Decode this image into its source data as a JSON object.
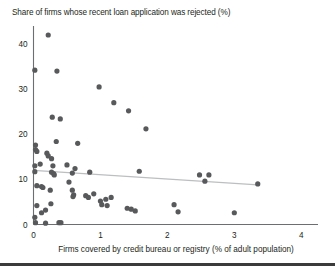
{
  "chart_data": {
    "type": "scatter",
    "title": "Share of firms whose recent loan application was rejected (%)",
    "xlabel": "Firms covered by credit bureau or registry (% of adult population)",
    "ylabel": "",
    "xlim": [
      0,
      4.25
    ],
    "ylim": [
      0,
      44
    ],
    "xticks": [
      0,
      1,
      2,
      3,
      4
    ],
    "xtick_labels": [
      "0",
      "1",
      "2",
      "3",
      "4"
    ],
    "yticks": [
      0,
      10,
      20,
      30,
      40
    ],
    "ytick_labels": [
      "0",
      "10",
      "20",
      "30",
      "40"
    ],
    "grid": false,
    "legend": null,
    "point_color": "#58595b",
    "trend_color": "#bcbec0",
    "axis_color": "#6d6e71",
    "series": [
      {
        "name": "Countries",
        "points": [
          [
            0.22,
            42.0
          ],
          [
            0.02,
            34.2
          ],
          [
            0.35,
            34.0
          ],
          [
            0.98,
            30.5
          ],
          [
            1.2,
            27.0
          ],
          [
            1.42,
            25.2
          ],
          [
            0.28,
            23.8
          ],
          [
            0.4,
            23.4
          ],
          [
            0.03,
            17.6
          ],
          [
            0.03,
            16.6
          ],
          [
            0.05,
            16.2
          ],
          [
            0.34,
            18.4
          ],
          [
            0.66,
            18.0
          ],
          [
            0.2,
            15.8
          ],
          [
            0.22,
            15.2
          ],
          [
            0.27,
            14.6
          ],
          [
            0.02,
            13.0
          ],
          [
            0.1,
            13.4
          ],
          [
            0.29,
            13.0
          ],
          [
            0.5,
            13.2
          ],
          [
            0.62,
            12.4
          ],
          [
            0.02,
            11.7
          ],
          [
            0.27,
            11.6
          ],
          [
            0.3,
            11.3
          ],
          [
            0.31,
            11.0
          ],
          [
            0.58,
            11.4
          ],
          [
            0.84,
            11.6
          ],
          [
            1.68,
            21.2
          ],
          [
            1.58,
            11.8
          ],
          [
            2.48,
            11.0
          ],
          [
            2.62,
            11.0
          ],
          [
            2.56,
            9.6
          ],
          [
            3.35,
            9.0
          ],
          [
            0.05,
            8.6
          ],
          [
            0.12,
            8.4
          ],
          [
            0.14,
            8.2
          ],
          [
            0.25,
            7.6
          ],
          [
            0.53,
            9.4
          ],
          [
            0.58,
            7.6
          ],
          [
            0.6,
            6.6
          ],
          [
            0.59,
            6.2
          ],
          [
            0.78,
            6.4
          ],
          [
            0.82,
            6.0
          ],
          [
            0.9,
            6.8
          ],
          [
            1.0,
            5.2
          ],
          [
            1.08,
            5.6
          ],
          [
            1.16,
            6.0
          ],
          [
            1.02,
            4.4
          ],
          [
            1.1,
            4.2
          ],
          [
            0.26,
            4.6
          ],
          [
            0.05,
            4.2
          ],
          [
            0.18,
            3.2
          ],
          [
            0.12,
            2.6
          ],
          [
            0.02,
            1.6
          ],
          [
            0.03,
            0.4
          ],
          [
            0.18,
            0.3
          ],
          [
            0.38,
            0.4
          ],
          [
            0.41,
            0.4
          ],
          [
            1.4,
            3.6
          ],
          [
            1.46,
            3.4
          ],
          [
            1.52,
            3.0
          ],
          [
            2.1,
            4.4
          ],
          [
            2.16,
            2.8
          ],
          [
            3.0,
            2.6
          ]
        ]
      }
    ],
    "trend": {
      "name": "fitted-trend",
      "x0": 0.0,
      "y0": 12.0,
      "x1": 3.35,
      "y1": 8.8
    }
  }
}
